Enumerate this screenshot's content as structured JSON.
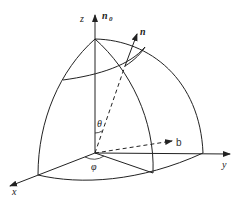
{
  "diagram": {
    "type": "spherical-coordinate-vector-diagram",
    "labels": {
      "z_axis": "z",
      "x_axis": "x",
      "y_axis": "y",
      "n0_main": "n",
      "n0_sub": "0",
      "n_vector": "n",
      "b_vector": "b",
      "theta": "θ",
      "phi": "φ"
    },
    "colors": {
      "stroke": "#222222",
      "background": "#ffffff"
    }
  }
}
